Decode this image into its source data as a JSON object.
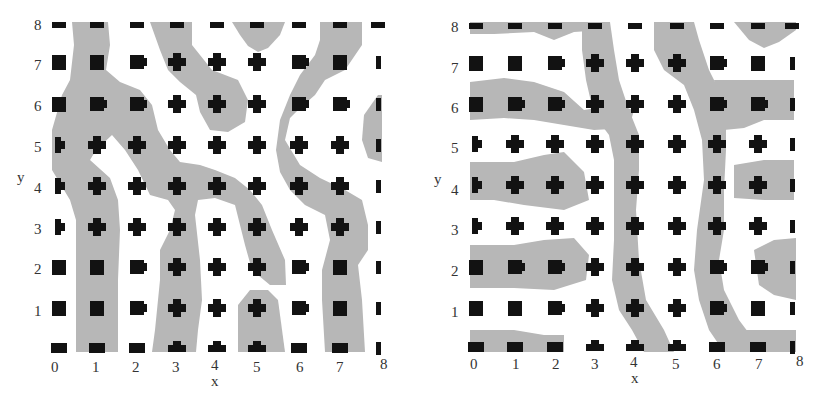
{
  "figure": {
    "panels": [
      {
        "id": "left",
        "xlabel": "x",
        "ylabel": "y",
        "xticks": [
          "0",
          "1",
          "2",
          "3",
          "4",
          "5",
          "6",
          "7",
          "8"
        ],
        "yticks": [
          "1",
          "2",
          "3",
          "4",
          "5",
          "6",
          "7",
          "8"
        ]
      },
      {
        "id": "right",
        "xlabel": "x",
        "ylabel": "y",
        "xticks": [
          "0",
          "1",
          "2",
          "3",
          "4",
          "5",
          "6",
          "7",
          "8"
        ],
        "yticks": [
          "1",
          "2",
          "3",
          "4",
          "5",
          "6",
          "7",
          "8"
        ]
      }
    ]
  },
  "chart_data": [
    {
      "type": "heatmap",
      "title": "",
      "xlabel": "x",
      "ylabel": "y",
      "xlim": [
        0,
        8
      ],
      "ylim": [
        0,
        8
      ],
      "description": "9x9 lattice of black square/cross-shaped markers on integer grid points, overlaid on grey domain pattern; grey domains form mostly vertical stripes/meandering bands",
      "marker_grid": "integer points x=0..8, y=0..8",
      "domain_orientation": "vertical"
    },
    {
      "type": "heatmap",
      "title": "",
      "xlabel": "x",
      "ylabel": "y",
      "xlim": [
        0,
        8
      ],
      "ylim": [
        0,
        8
      ],
      "description": "9x9 lattice of black square/cross-shaped markers on integer grid points, overlaid on grey domain pattern; grey domains form mostly horizontal stripes on left, vertical bands near x=4 and x=6",
      "marker_grid": "integer points x=0..8, y=0..8",
      "domain_orientation": "mixed"
    }
  ],
  "colors": {
    "domain": "#b4b4b4",
    "marker": "#111111",
    "background": "#ffffff"
  }
}
